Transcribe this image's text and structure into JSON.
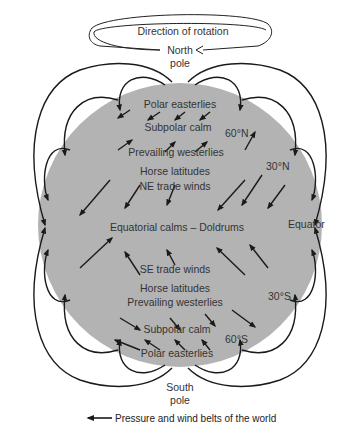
{
  "title": "Pressure and wind belts of the world",
  "rotation_label": "Direction of rotation",
  "poles": {
    "north": [
      "North",
      "pole"
    ],
    "south": [
      "South",
      "pole"
    ]
  },
  "belts": {
    "north_polar_easterlies": "Polar easterlies",
    "north_subpolar_calm": "Subpolar calm",
    "north_prevailing_westerlies": "Prevailing westerlies",
    "north_horse_latitudes": "Horse latitudes",
    "ne_trade_winds": "NE trade winds",
    "doldrums": "Equatorial calms – Doldrums",
    "se_trade_winds": "SE trade winds",
    "south_horse_latitudes": "Horse latitudes",
    "south_prevailing_westerlies": "Prevailing westerlies",
    "south_subpolar_calm": "Subpolar calm",
    "south_polar_easterlies": "Polar easterlies"
  },
  "latitudes": {
    "n60": "60°N",
    "n30": "30°N",
    "equator": "Equator",
    "s30": "30°S",
    "s60": "60°S"
  },
  "colors": {
    "globe": "#b3b3b3",
    "arrow": "#1a1a1a",
    "text": "#333333"
  }
}
